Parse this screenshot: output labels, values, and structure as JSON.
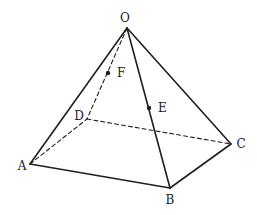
{
  "diagram": {
    "stroke_color": "#1f1f1f",
    "vertices": {
      "O": {
        "label": "O",
        "x": 127,
        "y": 28,
        "lx": 125,
        "ly": 22
      },
      "A": {
        "label": "A",
        "x": 30,
        "y": 164,
        "lx": 22,
        "ly": 170
      },
      "B": {
        "label": "B",
        "x": 170,
        "y": 188,
        "lx": 170,
        "ly": 204
      },
      "C": {
        "label": "C",
        "x": 231,
        "y": 144,
        "lx": 241,
        "ly": 148
      },
      "D": {
        "label": "D",
        "x": 87,
        "y": 119,
        "lx": 79,
        "ly": 120
      }
    },
    "points": {
      "E": {
        "label": "E",
        "x": 149,
        "y": 108,
        "lx": 158,
        "ly": 112,
        "on_edge": "OB"
      },
      "F": {
        "label": "F",
        "x": 108,
        "y": 73,
        "lx": 117,
        "ly": 77,
        "on_edge": "OD"
      }
    },
    "solid_edges": [
      [
        "O",
        "A"
      ],
      [
        "O",
        "B"
      ],
      [
        "O",
        "C"
      ],
      [
        "A",
        "B"
      ],
      [
        "B",
        "C"
      ]
    ],
    "dashed_edges": [
      [
        "O",
        "D"
      ],
      [
        "A",
        "D"
      ],
      [
        "D",
        "C"
      ]
    ]
  }
}
